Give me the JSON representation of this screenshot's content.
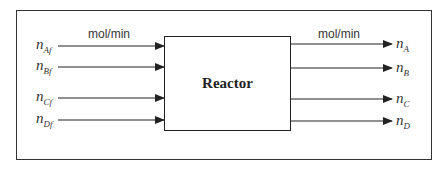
{
  "diagram": {
    "center_block": {
      "label": "Reactor"
    },
    "inputs": {
      "unit": "mol/min",
      "streams": [
        {
          "symbol": "n",
          "subscript": "Af",
          "y": 46
        },
        {
          "symbol": "n",
          "subscript": "Bf",
          "y": 67
        },
        {
          "symbol": "n",
          "subscript": "Cf",
          "y": 98
        },
        {
          "symbol": "n",
          "subscript": "Df",
          "y": 120
        }
      ]
    },
    "outputs": {
      "unit": "mol/min",
      "streams": [
        {
          "symbol": "n",
          "subscript": "A",
          "y": 44
        },
        {
          "symbol": "n",
          "subscript": "B",
          "y": 68
        },
        {
          "symbol": "n",
          "subscript": "C",
          "y": 99
        },
        {
          "symbol": "n",
          "subscript": "D",
          "y": 121
        }
      ]
    },
    "colors": {
      "line": "#222222",
      "background": "#ffffff"
    }
  }
}
